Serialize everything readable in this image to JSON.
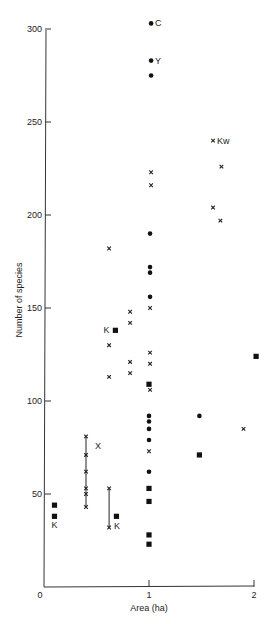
{
  "chart_data": {
    "type": "scatter",
    "title": "",
    "xlabel": "Area (ha)",
    "ylabel": "Number of species",
    "xlim": [
      0,
      2
    ],
    "ylim": [
      0,
      300
    ],
    "x_ticks": [
      "0",
      "1",
      "2"
    ],
    "y_ticks": [
      "50",
      "100",
      "150",
      "200",
      "250",
      "300"
    ],
    "grid": false,
    "legend": null,
    "series": [
      {
        "name": "circles",
        "marker": "dot",
        "points": [
          {
            "x": 1.02,
            "y": 303,
            "label": "C"
          },
          {
            "x": 1.02,
            "y": 283,
            "label": "Y"
          },
          {
            "x": 1.02,
            "y": 275
          },
          {
            "x": 1.01,
            "y": 190
          },
          {
            "x": 1.01,
            "y": 172
          },
          {
            "x": 1.01,
            "y": 169
          },
          {
            "x": 1.01,
            "y": 156
          },
          {
            "x": 1.0,
            "y": 92
          },
          {
            "x": 1.0,
            "y": 89
          },
          {
            "x": 1.0,
            "y": 85
          },
          {
            "x": 1.0,
            "y": 79
          },
          {
            "x": 1.0,
            "y": 62
          },
          {
            "x": 1.48,
            "y": 92
          }
        ]
      },
      {
        "name": "crosses",
        "marker": "x",
        "points": [
          {
            "x": 1.61,
            "y": 240,
            "label": "Kw"
          },
          {
            "x": 1.69,
            "y": 226
          },
          {
            "x": 1.61,
            "y": 204
          },
          {
            "x": 1.68,
            "y": 197
          },
          {
            "x": 1.02,
            "y": 223
          },
          {
            "x": 1.02,
            "y": 216
          },
          {
            "x": 0.62,
            "y": 182
          },
          {
            "x": 1.01,
            "y": 150
          },
          {
            "x": 0.82,
            "y": 148
          },
          {
            "x": 0.82,
            "y": 142
          },
          {
            "x": 0.62,
            "y": 130
          },
          {
            "x": 1.01,
            "y": 126
          },
          {
            "x": 0.82,
            "y": 121
          },
          {
            "x": 1.01,
            "y": 120
          },
          {
            "x": 0.82,
            "y": 115
          },
          {
            "x": 0.62,
            "y": 113
          },
          {
            "x": 1.01,
            "y": 106
          },
          {
            "x": 1.0,
            "y": 73
          },
          {
            "x": 1.9,
            "y": 85
          }
        ]
      },
      {
        "name": "squares",
        "marker": "square",
        "points": [
          {
            "x": 0.68,
            "y": 138,
            "label": "K"
          },
          {
            "x": 1.0,
            "y": 109
          },
          {
            "x": 2.02,
            "y": 124
          },
          {
            "x": 1.48,
            "y": 71
          },
          {
            "x": 1.0,
            "y": 53
          },
          {
            "x": 1.0,
            "y": 46
          },
          {
            "x": 1.0,
            "y": 28
          },
          {
            "x": 1.0,
            "y": 23
          },
          {
            "x": 0.1,
            "y": 44
          },
          {
            "x": 0.1,
            "y": 38,
            "label": "K"
          },
          {
            "x": 0.69,
            "y": 38
          }
        ]
      },
      {
        "name": "range X",
        "marker": "x-line",
        "label": "X",
        "points": [
          {
            "x": 0.4,
            "y": 81
          },
          {
            "x": 0.4,
            "y": 71
          },
          {
            "x": 0.4,
            "y": 62
          },
          {
            "x": 0.4,
            "y": 53
          },
          {
            "x": 0.4,
            "y": 50
          },
          {
            "x": 0.4,
            "y": 43
          }
        ]
      },
      {
        "name": "range K",
        "marker": "x-line",
        "label": "K",
        "points": [
          {
            "x": 0.62,
            "y": 53
          },
          {
            "x": 0.62,
            "y": 32
          }
        ]
      }
    ]
  },
  "axes": {
    "xlabel": "Area (ha)",
    "ylabel": "Number of species",
    "xticks": [
      "0",
      "1",
      "2"
    ],
    "yticks": [
      "50",
      "100",
      "150",
      "200",
      "250",
      "300"
    ]
  }
}
